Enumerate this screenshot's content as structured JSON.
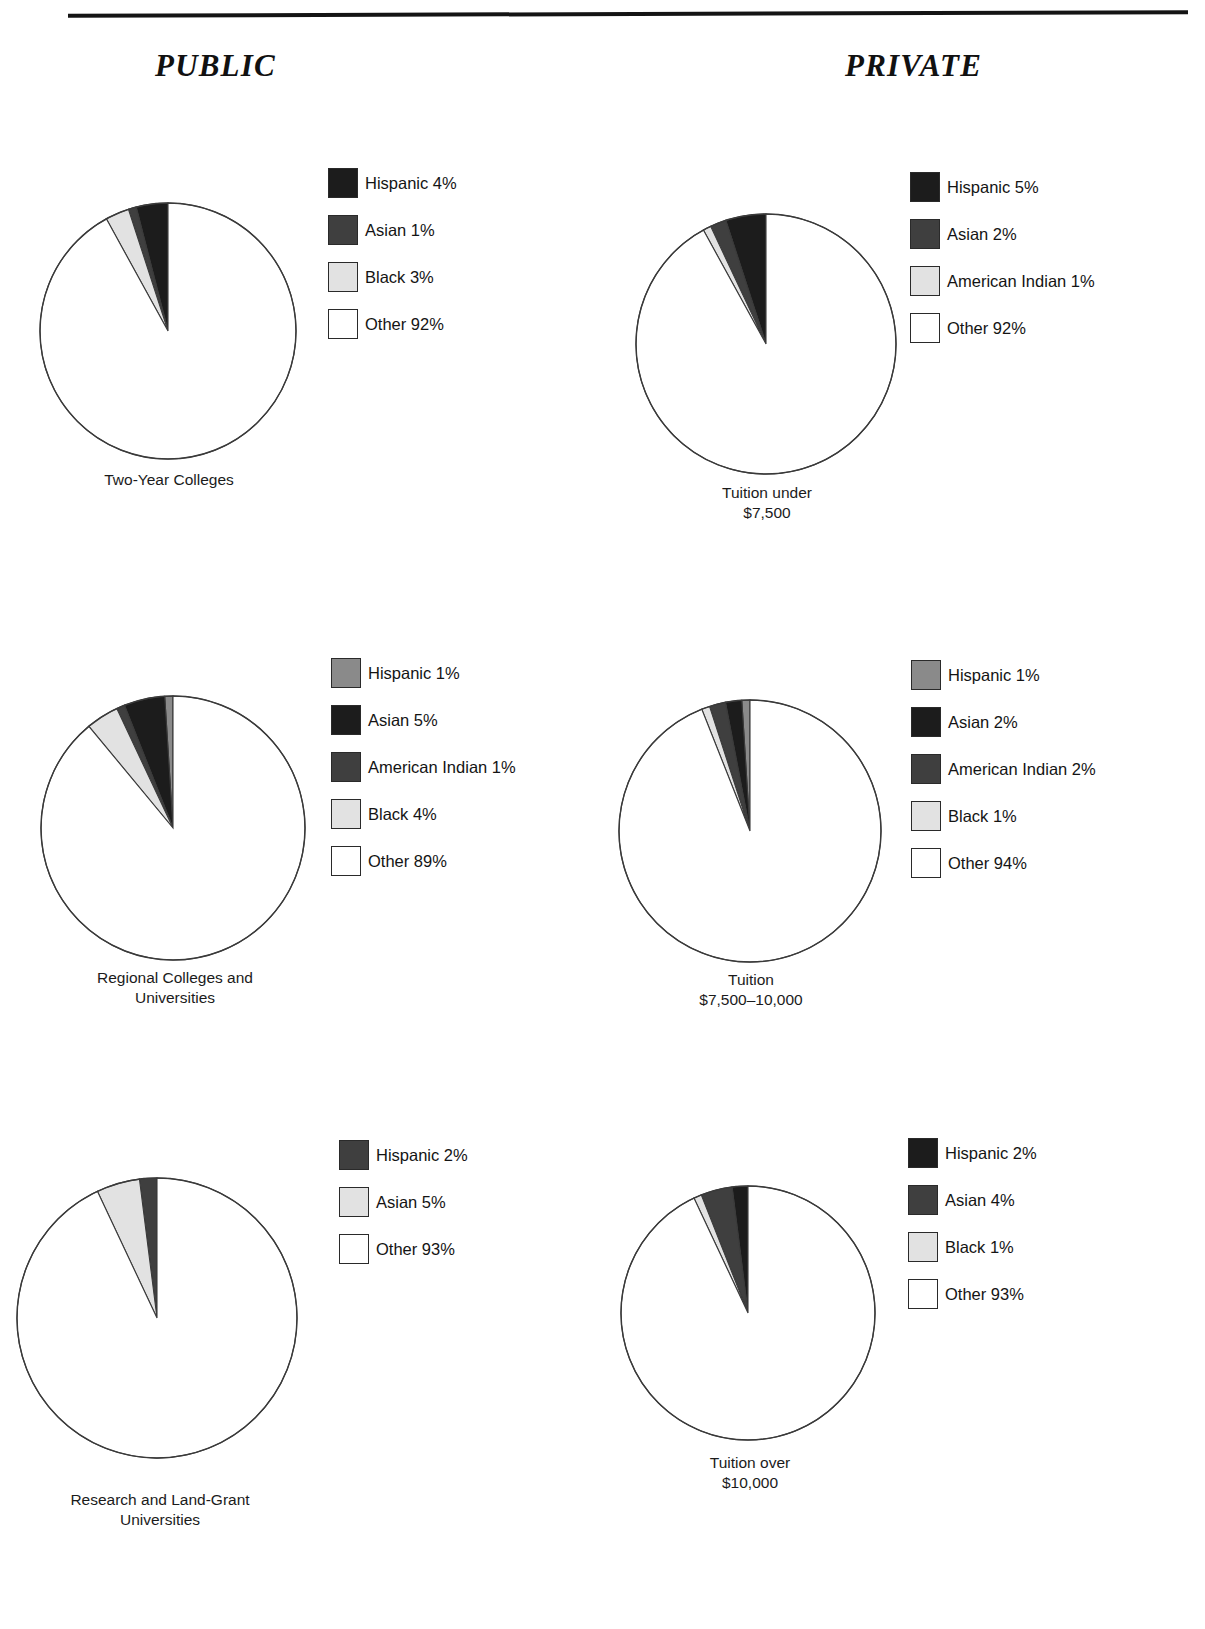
{
  "page": {
    "rule": "horizontal-rule",
    "columns": [
      {
        "id": "public",
        "title": "PUBLIC"
      },
      {
        "id": "private",
        "title": "PRIVATE"
      }
    ]
  },
  "palette": {
    "near_black": "#1c1c1c",
    "dark_gray": "#3f3f3f",
    "medium_gray": "#8a8a8a",
    "light_gray": "#e2e2e2",
    "white": "#ffffff",
    "outline": "#3a3a3a",
    "text": "#141414"
  },
  "chart_data": [
    {
      "id": "public-two-year",
      "type": "pie",
      "column": "PUBLIC",
      "title": "Two-Year Colleges",
      "start_angle_deg": 90,
      "direction": "counterclockwise",
      "categories": [
        "Hispanic",
        "Asian",
        "Black",
        "Other"
      ],
      "values": [
        4,
        1,
        3,
        92
      ],
      "colors": [
        "#1c1c1c",
        "#3f3f3f",
        "#e2e2e2",
        "#ffffff"
      ],
      "legend": [
        {
          "label": "Hispanic 4%",
          "color": "#1c1c1c"
        },
        {
          "label": "Asian 1%",
          "color": "#3f3f3f"
        },
        {
          "label": "Black 3%",
          "color": "#e2e2e2"
        },
        {
          "label": "Other 92%",
          "color": "#ffffff"
        }
      ]
    },
    {
      "id": "private-under-7500",
      "type": "pie",
      "column": "PRIVATE",
      "title": "Tuition under\n$7,500",
      "start_angle_deg": 90,
      "direction": "counterclockwise",
      "categories": [
        "Hispanic",
        "Asian",
        "American Indian",
        "Other"
      ],
      "values": [
        5,
        2,
        1,
        92
      ],
      "colors": [
        "#1c1c1c",
        "#3f3f3f",
        "#e2e2e2",
        "#ffffff"
      ],
      "legend": [
        {
          "label": "Hispanic 5%",
          "color": "#1c1c1c"
        },
        {
          "label": "Asian 2%",
          "color": "#3f3f3f"
        },
        {
          "label": "American Indian 1%",
          "color": "#e2e2e2"
        },
        {
          "label": "Other 92%",
          "color": "#ffffff"
        }
      ]
    },
    {
      "id": "public-regional",
      "type": "pie",
      "column": "PUBLIC",
      "title": "Regional Colleges and\nUniversities",
      "start_angle_deg": 90,
      "direction": "counterclockwise",
      "categories": [
        "Hispanic",
        "Asian",
        "American Indian",
        "Black",
        "Other"
      ],
      "values": [
        1,
        5,
        1,
        4,
        89
      ],
      "colors": [
        "#8a8a8a",
        "#1c1c1c",
        "#3f3f3f",
        "#e2e2e2",
        "#ffffff"
      ],
      "legend": [
        {
          "label": "Hispanic 1%",
          "color": "#8a8a8a"
        },
        {
          "label": "Asian 5%",
          "color": "#1c1c1c"
        },
        {
          "label": "American Indian 1%",
          "color": "#3f3f3f"
        },
        {
          "label": "Black 4%",
          "color": "#e2e2e2"
        },
        {
          "label": "Other 89%",
          "color": "#ffffff"
        }
      ]
    },
    {
      "id": "private-7500-10000",
      "type": "pie",
      "column": "PRIVATE",
      "title": "Tuition\n$7,500–10,000",
      "start_angle_deg": 90,
      "direction": "counterclockwise",
      "categories": [
        "Hispanic",
        "Asian",
        "American Indian",
        "Black",
        "Other"
      ],
      "values": [
        1,
        2,
        2,
        1,
        94
      ],
      "colors": [
        "#8a8a8a",
        "#1c1c1c",
        "#3f3f3f",
        "#e2e2e2",
        "#ffffff"
      ],
      "legend": [
        {
          "label": "Hispanic 1%",
          "color": "#8a8a8a"
        },
        {
          "label": "Asian 2%",
          "color": "#1c1c1c"
        },
        {
          "label": "American Indian 2%",
          "color": "#3f3f3f"
        },
        {
          "label": "Black 1%",
          "color": "#e2e2e2"
        },
        {
          "label": "Other 94%",
          "color": "#ffffff"
        }
      ]
    },
    {
      "id": "public-research",
      "type": "pie",
      "column": "PUBLIC",
      "title": "Research and Land-Grant\nUniversities",
      "start_angle_deg": 90,
      "direction": "counterclockwise",
      "categories": [
        "Hispanic",
        "Asian",
        "Other"
      ],
      "values": [
        2,
        5,
        93
      ],
      "colors": [
        "#3f3f3f",
        "#e2e2e2",
        "#ffffff"
      ],
      "legend": [
        {
          "label": "Hispanic 2%",
          "color": "#3f3f3f"
        },
        {
          "label": "Asian 5%",
          "color": "#e2e2e2"
        },
        {
          "label": "Other 93%",
          "color": "#ffffff"
        }
      ]
    },
    {
      "id": "private-over-10000",
      "type": "pie",
      "column": "PRIVATE",
      "title": "Tuition over\n$10,000",
      "start_angle_deg": 90,
      "direction": "counterclockwise",
      "categories": [
        "Hispanic",
        "Asian",
        "Black",
        "Other"
      ],
      "values": [
        2,
        4,
        1,
        93
      ],
      "colors": [
        "#1c1c1c",
        "#3f3f3f",
        "#e2e2e2",
        "#ffffff"
      ],
      "legend": [
        {
          "label": "Hispanic 2%",
          "color": "#1c1c1c"
        },
        {
          "label": "Asian 4%",
          "color": "#3f3f3f"
        },
        {
          "label": "Black 1%",
          "color": "#e2e2e2"
        },
        {
          "label": "Other 93%",
          "color": "#ffffff"
        }
      ]
    }
  ],
  "layout": {
    "pies": [
      {
        "id": "public-two-year",
        "cx": 168,
        "cy": 331,
        "r": 128,
        "caption_top": 470,
        "caption_left": 38,
        "caption_width": 262
      },
      {
        "id": "private-under-7500",
        "cx": 766,
        "cy": 344,
        "r": 130,
        "caption_top": 483,
        "caption_left": 636,
        "caption_width": 262
      },
      {
        "id": "public-regional",
        "cx": 173,
        "cy": 828,
        "r": 132,
        "caption_top": 968,
        "caption_left": 40,
        "caption_width": 270
      },
      {
        "id": "private-7500-10000",
        "cx": 750,
        "cy": 831,
        "r": 131,
        "caption_top": 970,
        "caption_left": 618,
        "caption_width": 266
      },
      {
        "id": "public-research",
        "cx": 157,
        "cy": 1318,
        "r": 140,
        "caption_top": 1490,
        "caption_left": 15,
        "caption_width": 290
      },
      {
        "id": "private-over-10000",
        "cx": 748,
        "cy": 1313,
        "r": 127,
        "caption_top": 1453,
        "caption_left": 618,
        "caption_width": 264
      }
    ],
    "legends": [
      {
        "id": "public-two-year",
        "left": 328,
        "top": 168
      },
      {
        "id": "private-under-7500",
        "left": 910,
        "top": 172
      },
      {
        "id": "public-regional",
        "left": 331,
        "top": 658
      },
      {
        "id": "private-7500-10000",
        "left": 911,
        "top": 660
      },
      {
        "id": "public-research",
        "left": 339,
        "top": 1140
      },
      {
        "id": "private-over-10000",
        "left": 908,
        "top": 1138
      }
    ]
  }
}
